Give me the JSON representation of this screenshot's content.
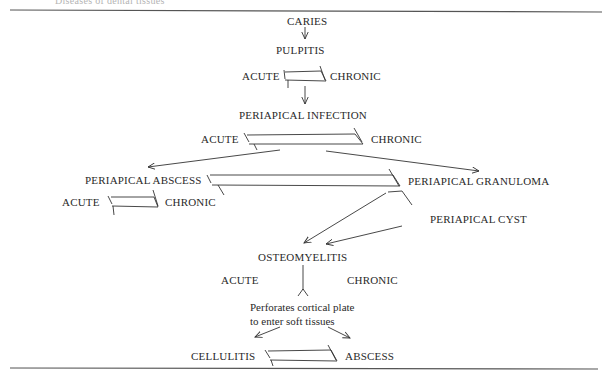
{
  "header": {
    "cut_text": "Diseases of dental tissues"
  },
  "nodes": {
    "caries": "CARIES",
    "pulpitis": "PULPITIS",
    "pulpitis_acute": "ACUTE",
    "pulpitis_chronic": "CHRONIC",
    "periapical_infection": "PERIAPICAL INFECTION",
    "infection_acute": "ACUTE",
    "infection_chronic": "CHRONIC",
    "periapical_abscess": "PERIAPICAL ABSCESS",
    "abscess_acute": "ACUTE",
    "abscess_chronic": "CHRONIC",
    "periapical_granuloma": "PERIAPICAL GRANULOMA",
    "periapical_cyst": "PERIAPICAL CYST",
    "osteomyelitis": "OSTEOMYELITIS",
    "osteo_acute": "ACUTE",
    "osteo_chronic": "CHRONIC",
    "perforates_line1": "Perforates cortical plate",
    "perforates_line2": "to enter soft tissues",
    "cellulitis": "CELLULITIS",
    "abscess": "ABSCESS"
  },
  "colors": {
    "ink": "#2a2a2a",
    "rule": "#555555",
    "background": "#ffffff"
  }
}
